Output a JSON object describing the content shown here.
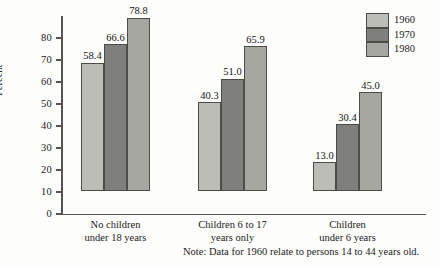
{
  "chart_data": {
    "type": "bar",
    "title": "",
    "subtitle": "",
    "xlabel": "",
    "ylabel": "Percent",
    "ylim": [
      0,
      80
    ],
    "ytick_step": 10,
    "yticks": [
      "0",
      "10",
      "20",
      "30",
      "40",
      "50",
      "60",
      "70",
      "80"
    ],
    "grid": false,
    "legend_position": "top-right",
    "categories": [
      "No children\nunder 18 years",
      "Children 6 to 17\nyears only",
      "Children\nunder 6 years"
    ],
    "category_lines": [
      [
        "No children",
        "under 18 years"
      ],
      [
        "Children 6 to 17",
        "years only"
      ],
      [
        "Children",
        "under 6 years"
      ]
    ],
    "series": [
      {
        "name": "1960",
        "color": "#bdbdb8",
        "values": [
          58.4,
          40.3,
          13.0
        ]
      },
      {
        "name": "1970",
        "color": "#7f7f7b",
        "values": [
          66.6,
          51.0,
          30.4
        ]
      },
      {
        "name": "1980",
        "color": "#a7a7a2",
        "values": [
          78.8,
          65.9,
          45.0
        ]
      }
    ],
    "data_labels": [
      [
        "58.4",
        "66.6",
        "78.8"
      ],
      [
        "40.3",
        "51.0",
        "65.9"
      ],
      [
        "13.0",
        "30.4",
        "45.0"
      ]
    ],
    "annotations": [
      "Note: Data for 1960 relate to persons 14 to 44 years old."
    ]
  },
  "legend": {
    "items": [
      {
        "label": "1960"
      },
      {
        "label": "1970"
      },
      {
        "label": "1980"
      }
    ]
  },
  "note": {
    "text": "Note: Data for 1960 relate to persons 14 to 44 years old."
  },
  "axis": {
    "y_title": "Percent"
  }
}
